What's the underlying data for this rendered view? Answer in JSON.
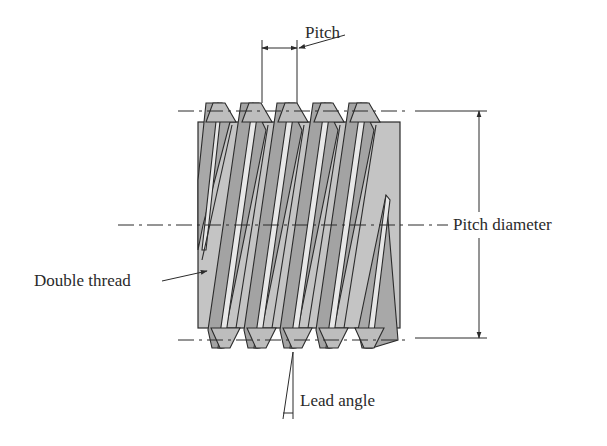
{
  "diagram": {
    "labels": {
      "pitch": "Pitch",
      "pitch_diameter": "Pitch diameter",
      "double_thread": "Double thread",
      "lead_angle": "Lead angle"
    },
    "colors": {
      "line": "#2b2b2b",
      "body_fill": "#c4c4c4",
      "flank_dark": "#9e9e9e",
      "flank_mid": "#b3b3b3",
      "crest_light": "#e6e6e6",
      "background": "#ffffff"
    },
    "geometry": {
      "body": {
        "x": 198,
        "y": 122,
        "width": 202,
        "height": 206
      },
      "crest_top_y": 103,
      "crest_bottom_y": 348,
      "top_centerline_y": 111,
      "pitch_centerline_y": 225,
      "bottom_centerline_y": 340,
      "tooth_count_visible": 5,
      "tooth_x_positions": [
        213,
        249,
        285,
        321,
        357
      ],
      "pitch_px": 36
    }
  }
}
